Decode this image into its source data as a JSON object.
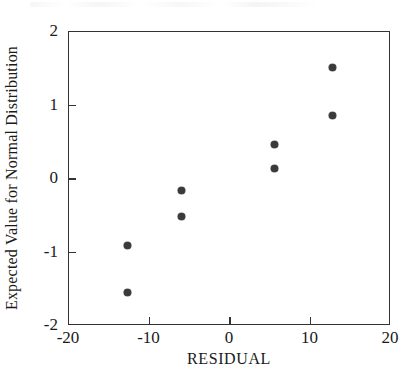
{
  "chart_data": {
    "type": "scatter",
    "title": "",
    "xlabel": "RESIDUAL",
    "ylabel": "Expected Value for Normal Distribution",
    "xlim": [
      -20,
      20
    ],
    "ylim": [
      -2,
      2
    ],
    "xticks": [
      -20,
      -10,
      0,
      10,
      20
    ],
    "yticks": [
      -2,
      -1,
      0,
      1,
      2
    ],
    "xticklabels": [
      "-20",
      "-10",
      "0",
      "10",
      "20"
    ],
    "yticklabels": [
      "-2",
      "-1",
      "0",
      "1",
      "2"
    ],
    "grid": false,
    "legend": null,
    "marker": "filled-circle",
    "marker_color": "#3a3a3a",
    "points": [
      {
        "x": -12.7,
        "y": -1.55
      },
      {
        "x": -12.7,
        "y": -0.9
      },
      {
        "x": -6.0,
        "y": -0.51
      },
      {
        "x": -6.0,
        "y": -0.16
      },
      {
        "x": 5.5,
        "y": 0.14
      },
      {
        "x": 5.5,
        "y": 0.47
      },
      {
        "x": 12.7,
        "y": 0.86
      },
      {
        "x": 12.7,
        "y": 1.52
      }
    ],
    "series": [
      {
        "name": "residual-normal-quantiles",
        "x": [
          -12.7,
          -12.7,
          -6.0,
          -6.0,
          5.5,
          5.5,
          12.7,
          12.7
        ],
        "values": [
          -1.55,
          -0.9,
          -0.51,
          -0.16,
          0.14,
          0.47,
          0.86,
          1.52
        ]
      }
    ]
  },
  "colors": {
    "axis": "#333333",
    "marker": "#3a3a3a",
    "background": "#ffffff"
  }
}
